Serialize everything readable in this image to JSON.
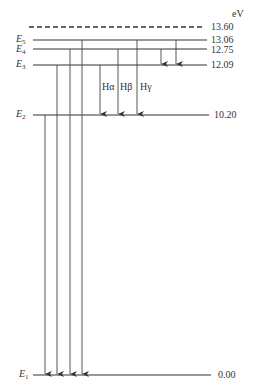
{
  "unit_label": "eV",
  "ionization": {
    "value": "13.60",
    "y": 27
  },
  "levels": [
    {
      "name": "E",
      "sub": "5",
      "value": "13.06",
      "y": 40
    },
    {
      "name": "E",
      "sub": "4",
      "value": "12.75",
      "y": 49
    },
    {
      "name": "E",
      "sub": "3",
      "value": "12.09",
      "y": 65
    },
    {
      "name": "E",
      "sub": "2",
      "value": "10.20",
      "y": 115
    },
    {
      "name": "E",
      "sub": "1",
      "value": "0.00",
      "y": 375
    }
  ],
  "balmer_labels": [
    "Hα",
    "Hβ",
    "Hγ"
  ],
  "transitions": [
    {
      "series": "Lyman",
      "from": "E2",
      "to": "E1",
      "x": 45
    },
    {
      "series": "Lyman",
      "from": "E3",
      "to": "E1",
      "x": 57
    },
    {
      "series": "Lyman",
      "from": "E4",
      "to": "E1",
      "x": 70
    },
    {
      "series": "Lyman",
      "from": "E5",
      "to": "E1",
      "x": 82
    },
    {
      "series": "Balmer",
      "label": "Hα",
      "from": "E3",
      "to": "E2",
      "x": 100
    },
    {
      "series": "Balmer",
      "label": "Hβ",
      "from": "E4",
      "to": "E2",
      "x": 118
    },
    {
      "series": "Balmer",
      "label": "Hγ",
      "from": "E5",
      "to": "E2",
      "x": 137
    },
    {
      "series": "Paschen",
      "from": "E4",
      "to": "E3",
      "x": 161
    },
    {
      "series": "Paschen",
      "from": "E5",
      "to": "E3",
      "x": 176
    }
  ]
}
